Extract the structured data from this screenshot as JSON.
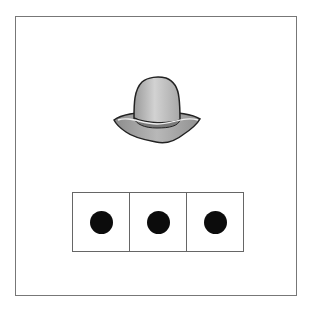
{
  "scene": {
    "picture": {
      "object": "hat",
      "icon": "hat-icon",
      "color": "#bdbdbd"
    },
    "counter": {
      "box_count": 3,
      "boxes": [
        {
          "dots": 1
        },
        {
          "dots": 1
        },
        {
          "dots": 1
        }
      ],
      "dot_color": "#0c0c0c"
    }
  }
}
